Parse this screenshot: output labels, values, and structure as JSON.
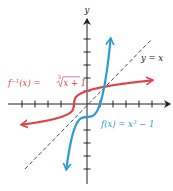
{
  "chart_data": {
    "type": "line",
    "title": "",
    "xlabel": "",
    "ylabel": "y",
    "xlim": [
      -5,
      5
    ],
    "ylim": [
      -6,
      6
    ],
    "grid": false,
    "tick_step": 1,
    "tick_labels": false,
    "series": [
      {
        "name": "f(x) = x³ − 1",
        "color": "#2a9bd4",
        "formula": "x^3 - 1",
        "points": [
          [
            -1.587,
            -5
          ],
          [
            -1,
            -2
          ],
          [
            -0.5,
            -1.125
          ],
          [
            0,
            -1
          ],
          [
            0.5,
            -0.875
          ],
          [
            1,
            0
          ],
          [
            1.32,
            1.32
          ],
          [
            1.817,
            5
          ]
        ]
      },
      {
        "name": "f⁻¹(x) = ∛(x + 1)",
        "color": "#d8474b",
        "formula": "cbrt(x + 1)",
        "points": [
          [
            -5,
            -1.587
          ],
          [
            -2,
            -1
          ],
          [
            -1.125,
            -0.5
          ],
          [
            -1,
            0
          ],
          [
            -0.875,
            0.5
          ],
          [
            0,
            1
          ],
          [
            1.32,
            1.32
          ],
          [
            5,
            1.817
          ]
        ]
      },
      {
        "name": "y = x",
        "color": "#222222",
        "style": "dashed",
        "points": [
          [
            -4.7,
            -5
          ],
          [
            5,
            5
          ]
        ]
      }
    ],
    "annotations": [
      {
        "text": "f⁻¹(x) = ∛(x + 1)",
        "color": "#d8474b"
      },
      {
        "text": "f(x) = x³ − 1",
        "color": "#2a9bd4"
      },
      {
        "text": "y = x",
        "color": "#222222"
      }
    ]
  },
  "labels": {
    "y_axis": "y",
    "inverse_prefix": "f",
    "inverse_sup": "−1",
    "inverse_mid": "(x) = ",
    "inverse_index": "3",
    "inverse_radicand": "x + 1",
    "func_main": "f(x) = x",
    "func_sup": "3",
    "func_tail": " − 1",
    "identity": "y = x"
  }
}
